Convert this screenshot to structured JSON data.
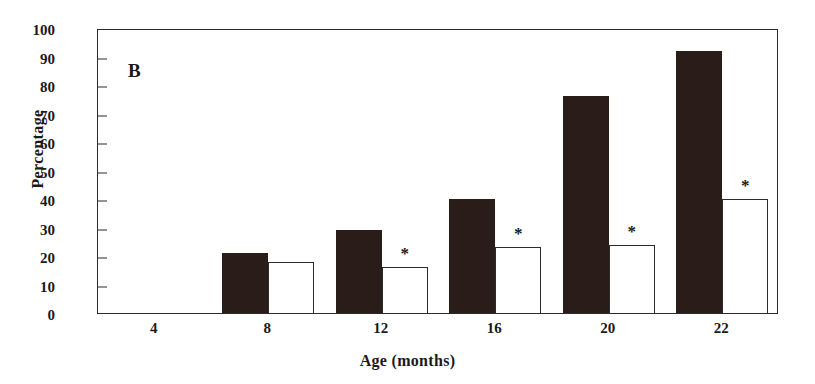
{
  "chart_data": {
    "type": "bar",
    "title": "",
    "panel_label": "B",
    "xlabel": "Age (months)",
    "ylabel": "Percentage",
    "categories": [
      "4",
      "8",
      "12",
      "16",
      "20",
      "22"
    ],
    "ylim": [
      0,
      100
    ],
    "yticks": [
      0,
      10,
      20,
      30,
      40,
      50,
      60,
      70,
      80,
      90,
      100
    ],
    "ytick_labels": [
      "0",
      "10",
      "20",
      "30",
      "40",
      "50",
      "60",
      "70",
      "80",
      "90",
      "100"
    ],
    "grid": false,
    "legend_position": "none",
    "series": [
      {
        "name": "filled",
        "style": "solid-black",
        "color": "#2a1d19",
        "values": [
          0,
          21,
          29,
          40,
          76,
          92
        ]
      },
      {
        "name": "open",
        "style": "outline-white",
        "color": "#ffffff",
        "edge_color": "#2b2b2b",
        "values": [
          0,
          18,
          16,
          23,
          24,
          40
        ]
      }
    ],
    "annotations": [
      {
        "label": "*",
        "category": "12",
        "series": "open",
        "value": 16
      },
      {
        "label": "*",
        "category": "16",
        "series": "open",
        "value": 23
      },
      {
        "label": "*",
        "category": "20",
        "series": "open",
        "value": 24
      },
      {
        "label": "*",
        "category": "22",
        "series": "open",
        "value": 40
      }
    ]
  }
}
